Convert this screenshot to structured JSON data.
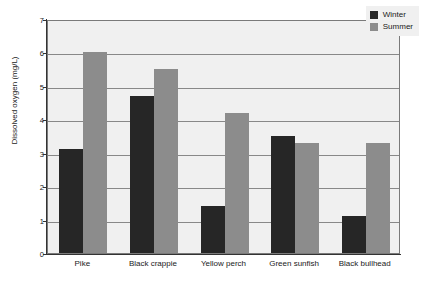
{
  "chart_data": {
    "type": "bar",
    "title": "",
    "xlabel": "",
    "ylabel": "Dissolved oxygen (mg/L)",
    "ylim": [
      0,
      7
    ],
    "yticks": [
      0,
      1,
      2,
      3,
      4,
      5,
      6,
      7
    ],
    "ytick_labels": [
      "0",
      "1",
      "2",
      "3",
      "4",
      "5",
      "6",
      "7"
    ],
    "grid": true,
    "legend_position": "top-right",
    "categories": [
      "Pike",
      "Black crappie",
      "Yellow perch",
      "Green sunfish",
      "Black bullhead"
    ],
    "series": [
      {
        "name": "Winter",
        "color": "#262626",
        "values": [
          3.1,
          4.7,
          1.4,
          3.5,
          1.1
        ]
      },
      {
        "name": "Summer",
        "color": "#8c8c8c",
        "values": [
          6.0,
          5.5,
          4.2,
          3.3,
          3.3
        ]
      }
    ]
  },
  "legend": {
    "items": [
      {
        "label": "Winter"
      },
      {
        "label": "Summer"
      }
    ]
  },
  "colors": {
    "winter": "#262626",
    "summer": "#8c8c8c",
    "plot_background": "#f0f0f0",
    "gridline": "#888888",
    "axis": "#333333",
    "page_background": "#ffffff"
  }
}
